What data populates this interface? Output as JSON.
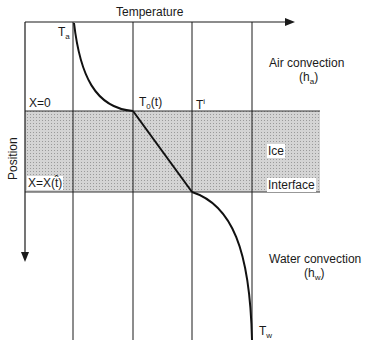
{
  "diagram": {
    "axes": {
      "x_label": "Temperature",
      "y_label": "Position"
    },
    "labels": {
      "t_a_main": "T",
      "t_a_sub": "a",
      "t0_main": "T",
      "t0_sub": "0",
      "t0_suffix": "(t)",
      "ti_main": "T",
      "ti_sup": "i",
      "x0": "X=0",
      "xt": "X=X(t̂)",
      "ice": "Ice",
      "interface": "Interface",
      "air_line1": "Air convection",
      "air_h": "(h",
      "air_sub": "a",
      "air_close": ")",
      "water_line1": "Water convection",
      "water_h": "(h",
      "water_sub": "w",
      "water_close": ")",
      "t_w_main": "T",
      "t_w_sub": "w"
    },
    "colors": {
      "line": "#1a1a1a",
      "ice_fill": "#c8c8c8"
    }
  }
}
